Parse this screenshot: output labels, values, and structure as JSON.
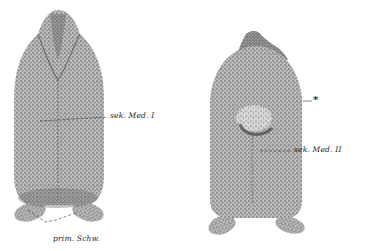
{
  "figure": {
    "left_embryo": {
      "view": "dorsal",
      "labels": {
        "sek_med_1": "sek. Med. I",
        "prim_schw": "prim. Schw."
      }
    },
    "right_embryo": {
      "view": "dorsal",
      "labels": {
        "asterisk": "*",
        "sek_med_2": "sek. Med. II"
      }
    }
  },
  "colors": {
    "ink": "#2a2a2a",
    "background": "#ffffff"
  }
}
